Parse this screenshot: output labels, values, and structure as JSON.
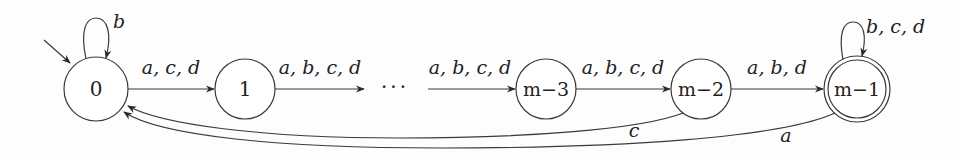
{
  "diagram": {
    "type": "finite-automaton",
    "states": [
      {
        "id": "s0",
        "label": "0",
        "initial": true,
        "accepting": false
      },
      {
        "id": "s1",
        "label": "1",
        "initial": false,
        "accepting": false
      },
      {
        "id": "sm3",
        "label": "m−3",
        "initial": false,
        "accepting": false
      },
      {
        "id": "sm2",
        "label": "m−2",
        "initial": false,
        "accepting": false
      },
      {
        "id": "sm1",
        "label": "m−1",
        "initial": false,
        "accepting": true
      }
    ],
    "ellipsis": "···",
    "transitions": [
      {
        "from": "s0",
        "to": "s0",
        "label": "b"
      },
      {
        "from": "s0",
        "to": "s1",
        "label": "a, c, d"
      },
      {
        "from": "s1",
        "to": "ellipsis",
        "label": "a, b, c, d"
      },
      {
        "from": "ellipsis",
        "to": "sm3",
        "label": "a, b, c, d"
      },
      {
        "from": "sm3",
        "to": "sm2",
        "label": "a, b, c, d"
      },
      {
        "from": "sm2",
        "to": "sm1",
        "label": "a, b, d"
      },
      {
        "from": "sm1",
        "to": "sm1",
        "label": "b, c, d"
      },
      {
        "from": "sm2",
        "to": "s0",
        "label": "c"
      },
      {
        "from": "sm1",
        "to": "s0",
        "label": "a"
      }
    ]
  }
}
